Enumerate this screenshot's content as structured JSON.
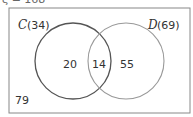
{
  "diagram": {
    "type": "venn",
    "universal_label_partial": "ξ = 168",
    "universal_total": "168",
    "sets": [
      {
        "name": "C",
        "total": "(34)",
        "color": "#555555"
      },
      {
        "name": "D",
        "total": "(69)",
        "color": "#999999"
      }
    ],
    "regions": {
      "only_C": "20",
      "C_and_D": "14",
      "only_D": "55",
      "outside": "79"
    },
    "colors": {
      "border": "#888888",
      "text": "#333333"
    }
  }
}
